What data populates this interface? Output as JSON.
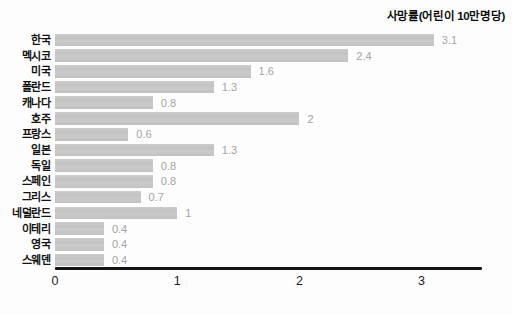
{
  "header": {
    "title": "사망률(어린이 10만명당)"
  },
  "chart_data": {
    "type": "bar",
    "orientation": "horizontal",
    "title": "사망률(어린이 10만명당)",
    "categories": [
      "한국",
      "멕시코",
      "미국",
      "폴란드",
      "캐나다",
      "호주",
      "프랑스",
      "일본",
      "독일",
      "스페인",
      "그리스",
      "네덜란드",
      "이테리",
      "영국",
      "스웨덴"
    ],
    "values": [
      3.1,
      2.4,
      1.6,
      1.3,
      0.8,
      2,
      0.6,
      1.3,
      0.8,
      0.8,
      0.7,
      1,
      0.4,
      0.4,
      0.4
    ],
    "value_labels": [
      "3.1",
      "2.4",
      "1.6",
      "1.3",
      "0.8",
      "2",
      "0.6",
      "1.3",
      "0.8",
      "0.8",
      "0.7",
      "1",
      "0.4",
      "0.4",
      "0.4"
    ],
    "xlabel": "",
    "ylabel": "",
    "x_ticks": [
      "0",
      "1",
      "2",
      "3"
    ],
    "xlim": [
      0,
      3.5
    ],
    "grid": false,
    "legend": "none",
    "bar_color": "#c6c6c6",
    "value_label_color": "#a4a4a4",
    "category_label_color": "#121212",
    "axis_color": "#141414",
    "tick_label_color": "#1c1c1c"
  }
}
